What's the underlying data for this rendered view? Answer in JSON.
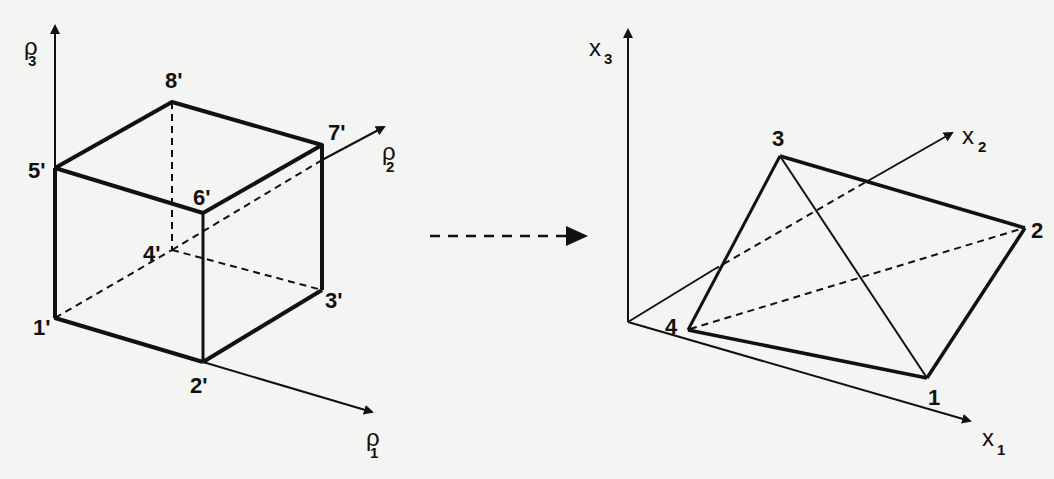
{
  "diagram": {
    "left": {
      "name": "cube",
      "axes": [
        {
          "symbol": "ρ",
          "subscript": "1"
        },
        {
          "symbol": "ρ",
          "subscript": "2"
        },
        {
          "symbol": "ρ",
          "subscript": "3"
        }
      ],
      "vertices": [
        "1'",
        "2'",
        "3'",
        "4'",
        "5'",
        "6'",
        "7'",
        "8'"
      ]
    },
    "mapping_arrow": "dashed-arrow-right",
    "right": {
      "name": "tetrahedron",
      "axes": [
        {
          "symbol": "x",
          "subscript": "1"
        },
        {
          "symbol": "x",
          "subscript": "2"
        },
        {
          "symbol": "x",
          "subscript": "3"
        }
      ],
      "vertices": [
        "1",
        "2",
        "3",
        "4"
      ]
    }
  },
  "colors": {
    "ink": "#111111",
    "paper": "#f4f4f2"
  }
}
